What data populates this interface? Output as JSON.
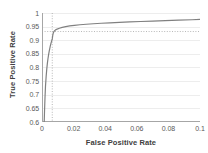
{
  "chart_data": {
    "type": "line",
    "title": "",
    "xlabel": "False Positive Rate",
    "ylabel": "True Positive Rate",
    "xlim": [
      0,
      0.1
    ],
    "ylim": [
      0.6,
      1
    ],
    "xticks": [
      0,
      0.02,
      0.04,
      0.06,
      0.08,
      0.1
    ],
    "xtick_labels": [
      "0",
      "0.02",
      "0.04",
      "0.06",
      "0.08",
      "0.1"
    ],
    "yticks": [
      0.6,
      0.65,
      0.7,
      0.75,
      0.8,
      0.85,
      0.9,
      0.95,
      1
    ],
    "ytick_labels": [
      "0.6",
      "0.65",
      "0.7",
      "0.75",
      "0.8",
      "0.85",
      "0.9",
      "0.95",
      "1"
    ],
    "grid": "horizontal",
    "legend": "none",
    "series": [
      {
        "name": "ROC curve",
        "color": "#808080",
        "x": [
          0.0014,
          0.0016,
          0.0019,
          0.0022,
          0.0026,
          0.003,
          0.0034,
          0.0038,
          0.0042,
          0.0046,
          0.005,
          0.0053,
          0.0056,
          0.0059,
          0.0062,
          0.0065,
          0.0068,
          0.0072,
          0.0078,
          0.0086,
          0.0096,
          0.011,
          0.0128,
          0.015,
          0.0175,
          0.0205,
          0.024,
          0.028,
          0.0325,
          0.0375,
          0.043,
          0.049,
          0.0555,
          0.0625,
          0.07,
          0.078,
          0.0865,
          0.095,
          0.1
        ],
        "y": [
          0.6,
          0.64,
          0.69,
          0.73,
          0.765,
          0.793,
          0.815,
          0.833,
          0.848,
          0.861,
          0.872,
          0.88,
          0.887,
          0.893,
          0.899,
          0.905,
          0.918,
          0.928,
          0.934,
          0.938,
          0.941,
          0.944,
          0.947,
          0.95,
          0.9525,
          0.9548,
          0.9568,
          0.9588,
          0.9606,
          0.9623,
          0.964,
          0.9656,
          0.9672,
          0.9688,
          0.9703,
          0.9719,
          0.9735,
          0.9752,
          0.9765
        ]
      }
    ],
    "annotations": [
      {
        "type": "reference-line",
        "orientation": "vertical",
        "x": 0.0065,
        "style": "dotted",
        "color": "#a6a6a6"
      },
      {
        "type": "reference-line",
        "orientation": "horizontal",
        "y": 0.932,
        "style": "dotted",
        "color": "#a6a6a6"
      }
    ],
    "colors": {
      "curve": "#808080",
      "axis": "#a6a6a6",
      "gridline": "#ededed",
      "tick_text": "#595959",
      "title_text": "#404040",
      "background": "#ffffff"
    }
  }
}
